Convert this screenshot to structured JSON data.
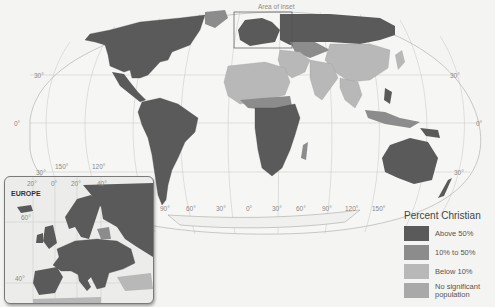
{
  "map": {
    "title": "Percent Christian",
    "inset_area_label": "Area of inset",
    "latitude_labels": [
      "30°",
      "0°",
      "30°"
    ],
    "longitude_labels": [
      "150°",
      "120°",
      "90°",
      "60°",
      "30°",
      "0°",
      "30°",
      "60°",
      "90°",
      "120°",
      "150°"
    ],
    "right_latitude_labels": [
      "30°",
      "0°",
      "30°"
    ]
  },
  "inset": {
    "title": "EUROPE",
    "longitude_labels": [
      "20°",
      "0°",
      "20°",
      "40°"
    ],
    "latitude_labels": [
      "60°",
      "40°"
    ]
  },
  "legend": {
    "title": "Percent Christian",
    "items": [
      {
        "label": "Above 50%",
        "color": "#5a5a5a"
      },
      {
        "label": "10% to 50%",
        "color": "#8c8c8c"
      },
      {
        "label": "Below 10%",
        "color": "#b8b8b8"
      },
      {
        "label": "No significant population",
        "color": "#a9a9a9"
      }
    ]
  },
  "colors": {
    "ocean": "#f4f4f2",
    "graticule": "#bdbdbd",
    "above_50": "#5a5a5a",
    "ten_to_50": "#8c8c8c",
    "below_10": "#b8b8b8",
    "none": "#a9a9a9"
  }
}
